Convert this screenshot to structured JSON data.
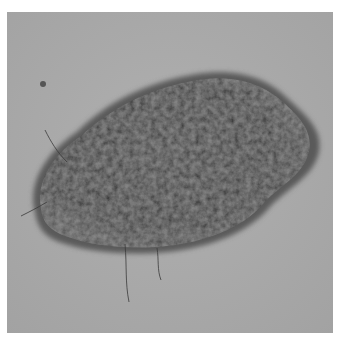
{
  "figure": {
    "colors": {
      "skin_background": "#a9a9a9",
      "lesion_dark": "#2e2e2e",
      "lesion_mid": "#4a4a4a",
      "lesion_highlight": "#6a6a6a",
      "page_background": "#ffffff"
    },
    "caption": ""
  }
}
